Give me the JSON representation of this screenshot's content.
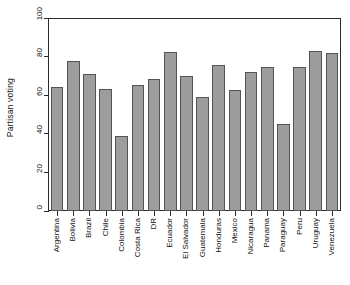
{
  "chart_data": {
    "type": "bar",
    "title": "",
    "xlabel": "",
    "ylabel": "Partisan voting",
    "ylim": [
      0,
      100
    ],
    "yticks": [
      0,
      20,
      40,
      60,
      80,
      100
    ],
    "grid": false,
    "legend": null,
    "bar_color": "#9d9d9d",
    "bar_edge_color": "#545454",
    "categories": [
      "Argentina",
      "Bolivia",
      "Brazil",
      "Chile",
      "Colombia",
      "Costa Rica",
      "DR",
      "Ecuador",
      "El Salvador",
      "Guatemala",
      "Honduras",
      "Mexico",
      "Nicaragua",
      "Panama",
      "Paraguay",
      "Peru",
      "Uruguay",
      "Venezuela"
    ],
    "values": [
      64,
      77.5,
      71,
      63,
      39,
      65.5,
      68.5,
      82.5,
      70,
      59,
      75.5,
      62.5,
      72,
      74.5,
      45,
      74.7,
      83,
      82
    ]
  }
}
